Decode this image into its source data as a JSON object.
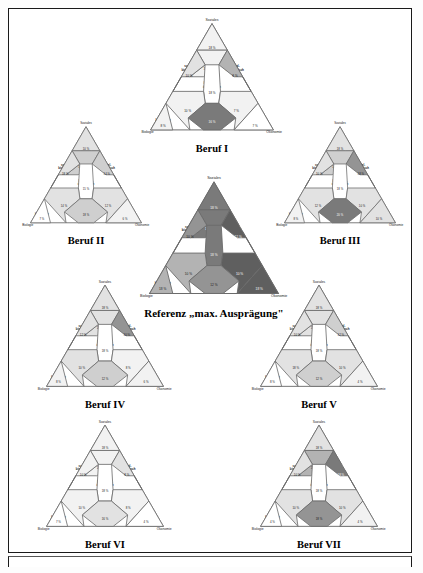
{
  "figure": {
    "axis_labels": {
      "top": "Soziales",
      "left": "Biologie",
      "right": "Ökonomie"
    },
    "cell_labels": {
      "top": "stark sozial",
      "upper_mid": "vorwiegend sozial",
      "left_upper": "sozial-biologisch",
      "right_upper": "sozial-ökonomisch",
      "center": "sozial-biologisch-ökonomisch",
      "left_lower": "vorwiegend biologisch",
      "right_lower": "vorwiegend ökonomisch",
      "bottom_mid": "biologisch-ökonomisch",
      "corner_left": "stark biologisch",
      "corner_right": "stark ökonomisch"
    },
    "palette": {
      "level_0": "#ffffff",
      "level_1": "#f2f2f2",
      "level_2": "#e2e2e2",
      "level_3": "#cfcfcf",
      "level_4": "#b3b3b3",
      "level_5": "#949494",
      "level_6": "#7a7a7a",
      "level_7": "#5f5f5f",
      "stroke": "#6b6b6b",
      "text": "#1a1a1a"
    },
    "percent_suffix": "%"
  },
  "chart_data": {
    "type": "table",
    "xlabel": "",
    "ylabel": "",
    "cell_order": [
      "top",
      "upper_mid",
      "left_upper",
      "right_upper",
      "center",
      "left_lower",
      "right_lower",
      "bottom_mid",
      "corner_left",
      "corner_right"
    ],
    "categories": [
      "stark sozial",
      "vorwiegend sozial",
      "sozial-biologisch",
      "sozial-ökonomisch",
      "sozial-biologisch-ökonomisch",
      "vorwiegend biologisch",
      "vorwiegend ökonomisch",
      "biologisch-ökonomisch",
      "stark biologisch",
      "stark ökonomisch"
    ],
    "series": [
      {
        "name": "Referenz „max. Ausprägung\"",
        "values": [
          18,
          12,
          10,
          12,
          18,
          10,
          10,
          12,
          18,
          18
        ]
      },
      {
        "name": "Beruf I",
        "values": [
          18,
          10,
          10,
          8,
          18,
          10,
          7,
          16,
          8,
          7
        ]
      },
      {
        "name": "Beruf II",
        "values": [
          10,
          18,
          18,
          14,
          15,
          14,
          12,
          18,
          7,
          6
        ]
      },
      {
        "name": "Beruf III",
        "values": [
          18,
          14,
          10,
          18,
          18,
          12,
          10,
          20,
          8,
          10
        ]
      },
      {
        "name": "Beruf IV",
        "values": [
          18,
          18,
          12,
          10,
          18,
          10,
          8,
          12,
          8,
          6
        ]
      },
      {
        "name": "Beruf V",
        "values": [
          18,
          12,
          10,
          12,
          18,
          18,
          10,
          12,
          8,
          4
        ]
      },
      {
        "name": "Beruf VI",
        "values": [
          18,
          10,
          10,
          8,
          18,
          10,
          8,
          16,
          7,
          4
        ]
      },
      {
        "name": "Beruf VII",
        "values": [
          18,
          18,
          10,
          18,
          18,
          10,
          10,
          18,
          4,
          4
        ]
      }
    ]
  },
  "triangles": [
    {
      "id": "beruf-i",
      "caption": "Beruf I",
      "x": 132,
      "y": 14,
      "w": 158,
      "h": 124,
      "scale": 1.0,
      "values": [
        18,
        10,
        10,
        8,
        18,
        10,
        7,
        16,
        8,
        7
      ],
      "shades": [
        "level_1",
        "level_1",
        "level_2",
        "level_4",
        "level_0",
        "level_1",
        "level_1",
        "level_6",
        "level_1",
        "level_0"
      ]
    },
    {
      "id": "beruf-ii",
      "caption": "Beruf II",
      "x": 14,
      "y": 118,
      "w": 142,
      "h": 112,
      "scale": 0.9,
      "values": [
        10,
        18,
        18,
        14,
        15,
        14,
        12,
        18,
        7,
        6
      ],
      "shades": [
        "level_2",
        "level_3",
        "level_2",
        "level_3",
        "level_0",
        "level_2",
        "level_2",
        "level_3",
        "level_0",
        "level_1"
      ]
    },
    {
      "id": "beruf-iii",
      "caption": "Beruf III",
      "x": 268,
      "y": 118,
      "w": 142,
      "h": 112,
      "scale": 0.9,
      "values": [
        18,
        14,
        10,
        18,
        18,
        12,
        10,
        20,
        8,
        10
      ],
      "shades": [
        "level_2",
        "level_3",
        "level_2",
        "level_5",
        "level_0",
        "level_2",
        "level_2",
        "level_6",
        "level_1",
        "level_2"
      ]
    },
    {
      "id": "referenz",
      "caption": "Referenz „max. Ausprägung\"",
      "x": 128,
      "y": 172,
      "w": 170,
      "h": 130,
      "scale": 1.08,
      "values": [
        18,
        12,
        10,
        12,
        18,
        10,
        10,
        12,
        18,
        18
      ],
      "values_dark": true,
      "shades": [
        "level_6",
        "level_6",
        "level_5",
        "level_7",
        "level_6",
        "level_4",
        "level_7",
        "level_5",
        "level_4",
        "level_7"
      ]
    },
    {
      "id": "beruf-iv",
      "caption": "Beruf IV",
      "x": 28,
      "y": 276,
      "w": 152,
      "h": 118,
      "scale": 0.95,
      "values": [
        18,
        18,
        12,
        10,
        18,
        10,
        8,
        12,
        8,
        6
      ],
      "shades": [
        "level_2",
        "level_2",
        "level_2",
        "level_5",
        "level_0",
        "level_2",
        "level_1",
        "level_3",
        "level_1",
        "level_1"
      ]
    },
    {
      "id": "beruf-v",
      "caption": "Beruf V",
      "x": 242,
      "y": 276,
      "w": 152,
      "h": 118,
      "scale": 0.95,
      "values": [
        18,
        12,
        10,
        12,
        18,
        18,
        10,
        12,
        8,
        4
      ],
      "shades": [
        "level_2",
        "level_2",
        "level_2",
        "level_3",
        "level_0",
        "level_2",
        "level_2",
        "level_3",
        "level_0",
        "level_1"
      ]
    },
    {
      "id": "beruf-vi",
      "caption": "Beruf VI",
      "x": 28,
      "y": 416,
      "w": 152,
      "h": 118,
      "scale": 0.95,
      "values": [
        18,
        10,
        10,
        8,
        18,
        10,
        8,
        16,
        7,
        4
      ],
      "shades": [
        "level_1",
        "level_1",
        "level_1",
        "level_2",
        "level_0",
        "level_1",
        "level_1",
        "level_2",
        "level_0",
        "level_0"
      ]
    },
    {
      "id": "beruf-vii",
      "caption": "Beruf VII",
      "x": 242,
      "y": 416,
      "w": 152,
      "h": 118,
      "scale": 0.95,
      "values": [
        18,
        18,
        10,
        18,
        18,
        10,
        10,
        18,
        4,
        4
      ],
      "shades": [
        "level_2",
        "level_4",
        "level_2",
        "level_6",
        "level_0",
        "level_2",
        "level_2",
        "level_5",
        "level_0",
        "level_1"
      ]
    }
  ]
}
